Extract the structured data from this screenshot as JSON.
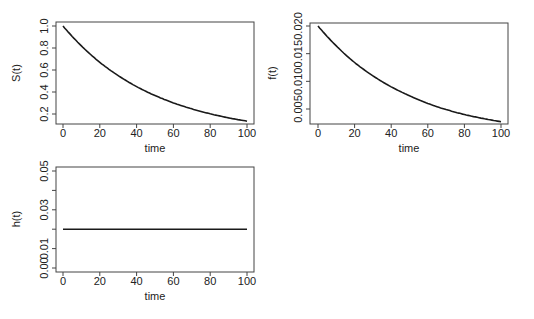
{
  "chart_data": [
    {
      "type": "line",
      "id": "survival",
      "title": "",
      "xlabel": "time",
      "ylabel": "S(t)",
      "xlim": [
        0,
        100
      ],
      "ylim": [
        0.11,
        1.04
      ],
      "xticks": [
        0,
        20,
        40,
        60,
        80,
        100
      ],
      "yticks": [
        0.2,
        0.4,
        0.6,
        0.8,
        1.0
      ],
      "ytick_labels": [
        "0.2",
        "0.4",
        "0.6",
        "0.8",
        "1.0"
      ],
      "grid": false,
      "series": [
        {
          "name": "S(t)",
          "x": [
            0,
            10,
            20,
            30,
            40,
            50,
            60,
            70,
            80,
            90,
            100
          ],
          "values": [
            1.0,
            0.819,
            0.67,
            0.549,
            0.449,
            0.368,
            0.301,
            0.247,
            0.202,
            0.165,
            0.135
          ]
        }
      ]
    },
    {
      "type": "line",
      "id": "density",
      "title": "",
      "xlabel": "time",
      "ylabel": "f(t)",
      "xlim": [
        0,
        100
      ],
      "ylim": [
        0.0019,
        0.0205
      ],
      "xticks": [
        0,
        20,
        40,
        60,
        80,
        100
      ],
      "yticks": [
        0.005,
        0.01,
        0.015,
        0.02
      ],
      "ytick_labels": [
        "0.005",
        "0.010",
        "0.015",
        "0.020"
      ],
      "grid": false,
      "series": [
        {
          "name": "f(t)",
          "x": [
            0,
            10,
            20,
            30,
            40,
            50,
            60,
            70,
            80,
            90,
            100
          ],
          "values": [
            0.02,
            0.0164,
            0.0134,
            0.011,
            0.009,
            0.0074,
            0.006,
            0.0049,
            0.004,
            0.0033,
            0.0027
          ]
        }
      ]
    },
    {
      "type": "line",
      "id": "hazard",
      "title": "",
      "xlabel": "time",
      "ylabel": "h(t)",
      "xlim": [
        0,
        100
      ],
      "ylim": [
        -0.002,
        0.052
      ],
      "xticks": [
        0,
        20,
        40,
        60,
        80,
        100
      ],
      "yticks": [
        0.0,
        0.01,
        0.02,
        0.03,
        0.04,
        0.05
      ],
      "ytick_labels": [
        "0.00",
        "0.01",
        "",
        "0.03",
        "",
        "0.05"
      ],
      "grid": false,
      "series": [
        {
          "name": "h(t)",
          "x": [
            0,
            100
          ],
          "values": [
            0.02,
            0.02
          ]
        }
      ]
    }
  ],
  "style": {
    "line_color": "#1a1a1a",
    "axis_color": "#444444",
    "text_color": "#222222"
  }
}
